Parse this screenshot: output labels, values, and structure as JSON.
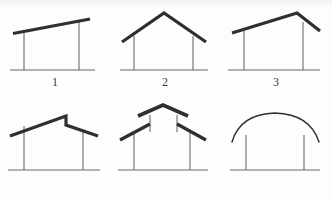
{
  "sheet": {
    "title": "Roof profile types",
    "background_color": "#fdfdfd",
    "roof_color": "#2f2f33",
    "wall_color": "#6b6b70",
    "ground_color": "#6b6b70",
    "caption_color": "#3a3a3c",
    "roof_stroke_width": 3.2,
    "thin_stroke_width": 1.1
  },
  "figures": [
    {
      "id": "figure-1",
      "caption": "1",
      "name": "shed-roof",
      "viewbox": "0 0 110 100",
      "ground": {
        "x1": 10,
        "y1": 70,
        "x2": 95,
        "y2": 70
      },
      "walls": [
        {
          "x1": 24,
          "y1": 70,
          "x2": 24,
          "y2": 33
        },
        {
          "x1": 79,
          "y1": 70,
          "x2": 79,
          "y2": 22
        }
      ],
      "roof_points": "13,33.5 90,19",
      "roof_curved": false
    },
    {
      "id": "figure-2",
      "caption": "2",
      "name": "gable-roof-symmetric",
      "viewbox": "0 0 110 100",
      "ground": {
        "x1": 10,
        "y1": 70,
        "x2": 98,
        "y2": 70
      },
      "walls": [
        {
          "x1": 24,
          "y1": 70,
          "x2": 24,
          "y2": 36
        },
        {
          "x1": 83,
          "y1": 70,
          "x2": 83,
          "y2": 36
        }
      ],
      "roof_points": "12,42 54,13 96,42",
      "roof_curved": false
    },
    {
      "id": "figure-3",
      "caption": "3",
      "name": "gable-roof-asymmetric",
      "viewbox": "0 0 112 100",
      "ground": {
        "x1": 8,
        "y1": 70,
        "x2": 100,
        "y2": 70
      },
      "walls": [
        {
          "x1": 24,
          "y1": 70,
          "x2": 24,
          "y2": 31
        },
        {
          "x1": 83,
          "y1": 70,
          "x2": 83,
          "y2": 22
        }
      ],
      "roof_points": "12,33 77,13 100,31",
      "roof_curved": false
    },
    {
      "id": "figure-4",
      "caption": "4",
      "name": "offset-ridge-roof",
      "viewbox": "0 0 110 100",
      "ground": {
        "x1": 8,
        "y1": 70,
        "x2": 100,
        "y2": 70
      },
      "walls": [
        {
          "x1": 24,
          "y1": 70,
          "x2": 24,
          "y2": 26
        },
        {
          "x1": 83,
          "y1": 70,
          "x2": 83,
          "y2": 30
        }
      ],
      "roof_points": "10,36 66,16 66,25 98,36",
      "roof_curved": false
    },
    {
      "id": "figure-5",
      "caption": "5",
      "name": "monitor-clerestory-roof",
      "viewbox": "0 0 110 100",
      "ground": {
        "x1": 8,
        "y1": 70,
        "x2": 98,
        "y2": 70
      },
      "walls": [
        {
          "x1": 24,
          "y1": 70,
          "x2": 24,
          "y2": 32
        },
        {
          "x1": 80,
          "y1": 70,
          "x2": 80,
          "y2": 32
        }
      ],
      "monitor_posts": [
        {
          "x1": 40,
          "y1": 32,
          "x2": 40,
          "y2": 15
        },
        {
          "x1": 67,
          "y1": 32,
          "x2": 67,
          "y2": 15
        }
      ],
      "roof_points": "28,16 53,5 78,16",
      "eave_left_points": "10,40 40,24",
      "eave_right_points": "96,40 67,24",
      "roof_curved": false
    },
    {
      "id": "figure-6",
      "caption": "6",
      "name": "arched-barrel-roof",
      "viewbox": "0 0 112 100",
      "ground": {
        "x1": 10,
        "y1": 70,
        "x2": 100,
        "y2": 70
      },
      "walls": [
        {
          "x1": 26,
          "y1": 70,
          "x2": 26,
          "y2": 35
        },
        {
          "x1": 84,
          "y1": 70,
          "x2": 84,
          "y2": 35
        }
      ],
      "arch_path": "M 12,42 Q 20,14 55,13 Q 90,14 99,42",
      "roof_curved": true
    }
  ]
}
